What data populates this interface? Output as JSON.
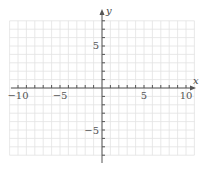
{
  "chart_data": {
    "type": "coordinate-grid",
    "title": "",
    "xlabel": "x",
    "ylabel": "y",
    "xlim": [
      -11,
      11
    ],
    "ylim": [
      -8,
      8
    ],
    "grid": true,
    "grid_step": 1,
    "x_ticks": [
      -10,
      -5,
      5,
      10
    ],
    "x_tick_labels": [
      "−10",
      "−5",
      "5",
      "10"
    ],
    "y_ticks": [
      5,
      -5
    ],
    "y_tick_labels": [
      "5",
      "−5"
    ],
    "series": []
  },
  "colors": {
    "grid": "#e2e2e2",
    "axis": "#555555",
    "text": "#555555"
  }
}
